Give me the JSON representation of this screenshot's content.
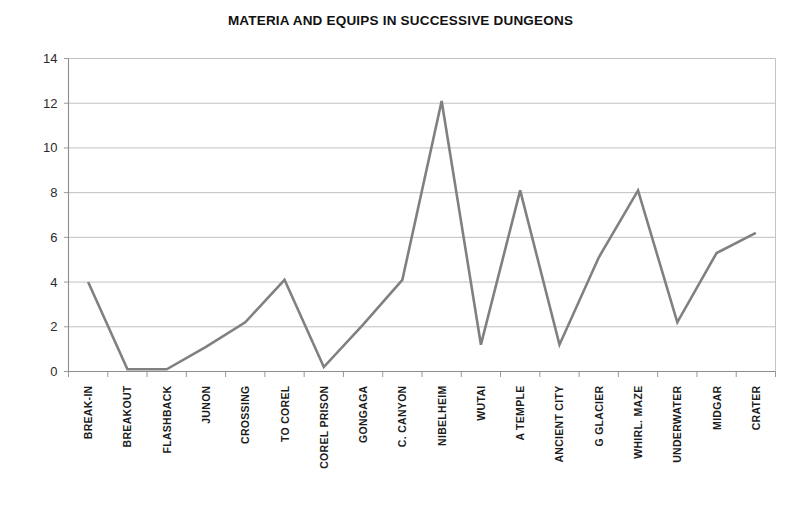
{
  "chart_data": {
    "type": "line",
    "title": "MATERIA AND EQUIPS IN SUCCESSIVE DUNGEONS",
    "xlabel": "",
    "ylabel": "",
    "categories": [
      "BREAK-IN",
      "BREAKOUT",
      "FLASHBACK",
      "JUNON",
      "CROSSING",
      "TO COREL",
      "COREL PRISON",
      "GONGAGA",
      "C. CANYON",
      "NIBELHEIM",
      "WUTAI",
      "A TEMPLE",
      "ANCIENT CITY",
      "G GLACIER",
      "WHIRL. MAZE",
      "UNDERWATER",
      "MIDGAR",
      "CRATER"
    ],
    "values": [
      4,
      0.1,
      0.1,
      1.1,
      2.2,
      4.1,
      0.2,
      2.1,
      4.1,
      12.1,
      1.2,
      8.1,
      1.2,
      5.1,
      8.1,
      2.2,
      5.3,
      6.2
    ],
    "series": [
      {
        "name": "Materia and equips",
        "values": [
          4,
          0.1,
          0.1,
          1.1,
          2.2,
          4.1,
          0.2,
          2.1,
          4.1,
          12.1,
          1.2,
          8.1,
          1.2,
          5.1,
          8.1,
          2.2,
          5.3,
          6.2
        ],
        "color": "#808080"
      }
    ],
    "ylim": [
      0,
      14
    ],
    "yticks": [
      0,
      2,
      4,
      6,
      8,
      10,
      12,
      14
    ],
    "ytick_labels": [
      "0",
      "2",
      "4",
      "6",
      "8",
      "10",
      "12",
      "14"
    ],
    "grid": "horizontal",
    "legend": "none",
    "line_color": "#808080",
    "grid_color": "#b9b9b9",
    "axis_color": "#8d8d8d",
    "background_color": "#ffffff"
  }
}
